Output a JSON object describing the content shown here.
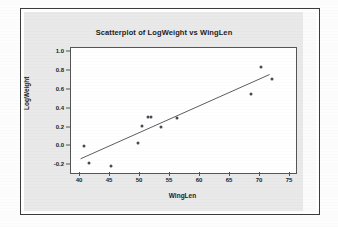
{
  "chart_data": {
    "type": "scatter",
    "title": "Scatterplot of LogWeight vs WingLen",
    "xlabel": "WingLen",
    "ylabel": "LogWeight",
    "xlim": [
      38.5,
      76.0
    ],
    "ylim": [
      -0.28,
      1.04
    ],
    "grid": false,
    "legend": "none",
    "xticks": [
      40,
      45,
      50,
      55,
      60,
      65,
      70,
      75
    ],
    "xtick_labels": [
      "40",
      "45",
      "50",
      "55",
      "60",
      "65",
      "70",
      "75"
    ],
    "yticks": [
      -0.2,
      0.0,
      0.2,
      0.4,
      0.6,
      0.8,
      1.0
    ],
    "ytick_labels": [
      "-0.2",
      "0.0",
      "0.2",
      "0.4",
      "0.6",
      "0.8",
      "1.0"
    ],
    "points": [
      {
        "x": 40.6,
        "y": 0.01
      },
      {
        "x": 41.5,
        "y": -0.17
      },
      {
        "x": 45.1,
        "y": -0.21
      },
      {
        "x": 49.7,
        "y": 0.04
      },
      {
        "x": 50.4,
        "y": 0.22
      },
      {
        "x": 51.4,
        "y": 0.31
      },
      {
        "x": 51.8,
        "y": 0.31
      },
      {
        "x": 53.5,
        "y": 0.21
      },
      {
        "x": 56.2,
        "y": 0.3
      },
      {
        "x": 68.5,
        "y": 0.55
      },
      {
        "x": 70.1,
        "y": 0.84
      },
      {
        "x": 72.0,
        "y": 0.71
      }
    ],
    "fit_line": {
      "name": "regression line",
      "x_start": 40.1,
      "y_start": -0.13,
      "x_end": 71.6,
      "y_end": 0.76
    }
  }
}
